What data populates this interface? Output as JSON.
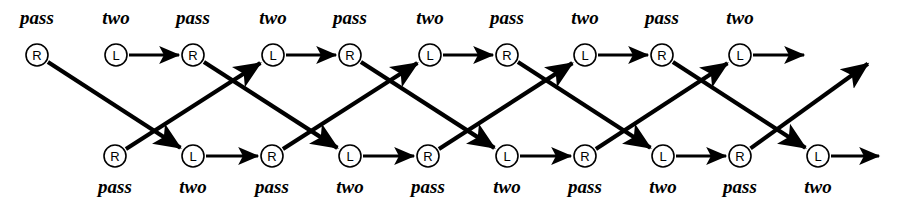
{
  "diagram": {
    "type": "trellis",
    "width": 901,
    "height": 207,
    "background_color": "#ffffff",
    "line_color": "#000000",
    "node_fill": "#ffffff",
    "geometry": {
      "top_row_y": 55,
      "bottom_row_y": 156,
      "top_label_y": 24,
      "bottom_label_y": 193,
      "node_radius": 11,
      "column_spacing": 77.5
    },
    "legend": {
      "letter_L": "L",
      "letter_R": "R",
      "label_pass": "pass",
      "label_two": "two"
    },
    "top_row": {
      "name": "top-row",
      "nodes": [
        {
          "letter": "R",
          "label": "pass",
          "x": 37
        },
        {
          "letter": "L",
          "label": "two",
          "x": 116
        },
        {
          "letter": "R",
          "label": "pass",
          "x": 193
        },
        {
          "letter": "L",
          "label": "two",
          "x": 273
        },
        {
          "letter": "R",
          "label": "pass",
          "x": 350
        },
        {
          "letter": "L",
          "label": "two",
          "x": 430
        },
        {
          "letter": "R",
          "label": "pass",
          "x": 507
        },
        {
          "letter": "L",
          "label": "two",
          "x": 585
        },
        {
          "letter": "R",
          "label": "pass",
          "x": 662
        },
        {
          "letter": "L",
          "label": "two",
          "x": 740
        }
      ]
    },
    "bottom_row": {
      "name": "bottom-row",
      "nodes": [
        {
          "letter": "R",
          "label": "pass",
          "x": 115
        },
        {
          "letter": "L",
          "label": "two",
          "x": 193
        },
        {
          "letter": "R",
          "label": "pass",
          "x": 272
        },
        {
          "letter": "L",
          "label": "two",
          "x": 350
        },
        {
          "letter": "R",
          "label": "pass",
          "x": 428
        },
        {
          "letter": "L",
          "label": "two",
          "x": 507
        },
        {
          "letter": "R",
          "label": "pass",
          "x": 585
        },
        {
          "letter": "L",
          "label": "two",
          "x": 663
        },
        {
          "letter": "R",
          "label": "pass",
          "x": 740
        },
        {
          "letter": "L",
          "label": "two",
          "x": 818
        }
      ]
    },
    "horizontal_edges": [
      {
        "row": "top",
        "from_x": 116,
        "to_x": 193
      },
      {
        "row": "top",
        "from_x": 273,
        "to_x": 350
      },
      {
        "row": "top",
        "from_x": 430,
        "to_x": 507
      },
      {
        "row": "top",
        "from_x": 585,
        "to_x": 662
      },
      {
        "row": "top",
        "from_x": 740,
        "to_x": 818
      },
      {
        "row": "bottom",
        "from_x": 193,
        "to_x": 272
      },
      {
        "row": "bottom",
        "from_x": 350,
        "to_x": 428
      },
      {
        "row": "bottom",
        "from_x": 507,
        "to_x": 585
      },
      {
        "row": "bottom",
        "from_x": 663,
        "to_x": 740
      },
      {
        "row": "bottom",
        "from_x": 818,
        "to_x": 893
      }
    ],
    "diagonal_edges": [
      {
        "direction": "down",
        "from_x": 37,
        "to_x": 193
      },
      {
        "direction": "down",
        "from_x": 193,
        "to_x": 350
      },
      {
        "direction": "down",
        "from_x": 350,
        "to_x": 507
      },
      {
        "direction": "down",
        "from_x": 507,
        "to_x": 663
      },
      {
        "direction": "down",
        "from_x": 662,
        "to_x": 818
      },
      {
        "direction": "up",
        "from_x": 115,
        "to_x": 273
      },
      {
        "direction": "up",
        "from_x": 272,
        "to_x": 430
      },
      {
        "direction": "up",
        "from_x": 428,
        "to_x": 585
      },
      {
        "direction": "up",
        "from_x": 585,
        "to_x": 740
      },
      {
        "direction": "up",
        "from_x": 740,
        "to_x": 880
      }
    ]
  }
}
